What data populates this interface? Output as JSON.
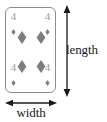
{
  "figure": {
    "background_color": "#ffffff"
  },
  "card": {
    "name": "four-of-diamonds",
    "rank": "4",
    "suit": "diamonds",
    "suit_symbol": "♦",
    "border_color": "#8c8c8c",
    "face_color": "#ffffff",
    "pip_color": "#808080",
    "index_color": "#9a9a9a",
    "corner_indices": [
      {
        "position": "top-left",
        "rank": "4"
      },
      {
        "position": "top-right",
        "rank": "4"
      },
      {
        "position": "bottom-left",
        "rank": "4"
      },
      {
        "position": "bottom-right",
        "rank": "4"
      }
    ],
    "center_pips": [
      {
        "position": "top-left"
      },
      {
        "position": "top-right"
      },
      {
        "position": "bottom-left"
      },
      {
        "position": "bottom-right"
      }
    ],
    "pip_count": 4
  },
  "dimensions": {
    "length": {
      "label": "length",
      "orientation": "vertical",
      "arrow": "double-headed",
      "color": "#1a1a1a"
    },
    "width": {
      "label": "width",
      "orientation": "horizontal",
      "arrow": "double-headed",
      "color": "#1a1a1a"
    }
  }
}
